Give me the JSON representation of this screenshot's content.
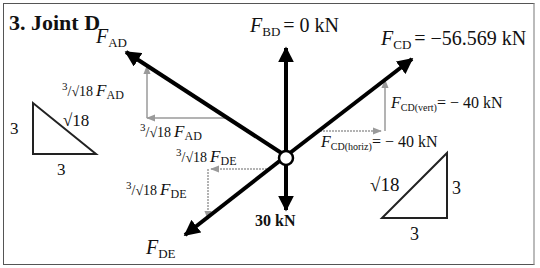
{
  "title": "3. Joint D",
  "joint": "D",
  "forces": {
    "ad": {
      "sym": "F",
      "sub": "AD"
    },
    "bd": {
      "sym": "F",
      "sub": "BD",
      "eq": "= 0 kN"
    },
    "cd": {
      "sym": "F",
      "sub": "CD",
      "eq": "= −56.569 kN"
    },
    "de": {
      "sym": "F",
      "sub": "DE"
    },
    "load": "30 kN"
  },
  "components": {
    "ad_vert": {
      "coef_num": "3",
      "coef_den": "/√18",
      "sym": "F",
      "sub": "AD"
    },
    "ad_horiz": {
      "coef_num": "3",
      "coef_den": "/√18",
      "sym": "F",
      "sub": "AD"
    },
    "de_horiz": {
      "coef_num": "3",
      "coef_den": "/√18",
      "sym": "F",
      "sub": "DE"
    },
    "de_vert": {
      "coef_num": "3",
      "coef_den": "/√18",
      "sym": "F",
      "sub": "DE"
    },
    "cd_vert": {
      "sym": "F",
      "sub": "CD(vert)",
      "eq": "= − 40 kN"
    },
    "cd_horiz": {
      "sym": "F",
      "sub": "CD(horiz)",
      "eq": "= − 40 kN"
    }
  },
  "triangle_left": {
    "vertical": "3",
    "hyp": "√18",
    "base": "3"
  },
  "triangle_right": {
    "vertical": "3",
    "hyp": "√18",
    "base": "3"
  },
  "colors": {
    "force": "#000000",
    "component": "#9a9a9a",
    "frame": "#555555"
  }
}
